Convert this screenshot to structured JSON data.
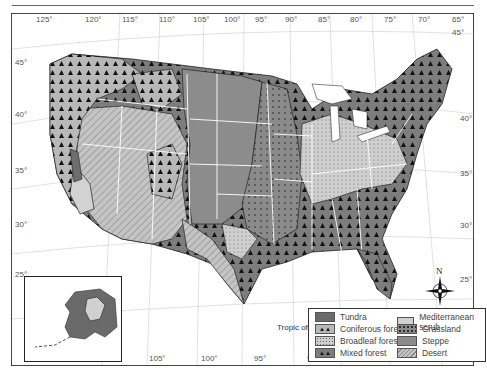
{
  "map": {
    "title": "Natural vegetation regions of the United States",
    "longitude_labels_top": [
      "125°",
      "120°",
      "115°",
      "110°",
      "105°",
      "100°",
      "95°",
      "90°",
      "85°",
      "80°",
      "75°",
      "70°",
      "65°"
    ],
    "longitude_labels_bottom": [
      "115°",
      "110°",
      "105°",
      "100°",
      "95°",
      "90°",
      "85°",
      "80°",
      "75°"
    ],
    "latitude_labels_left": [
      "45°",
      "40°",
      "35°",
      "30°",
      "25°"
    ],
    "latitude_labels_right": [
      "45°",
      "40°",
      "35°",
      "30°",
      "25°"
    ],
    "tropic_label": "Tropic of Cancer",
    "compass": {
      "north_label": "N"
    }
  },
  "legend": {
    "items": [
      {
        "label": "Tundra",
        "pattern": "solid-dark",
        "color": "#6a6a6a"
      },
      {
        "label": "Coniferous forest",
        "pattern": "triangles",
        "color": "#b8b8b8"
      },
      {
        "label": "Broadleaf forest",
        "pattern": "dots-light",
        "color": "#cfcfcf"
      },
      {
        "label": "Mixed forest",
        "pattern": "triangles-dark",
        "color": "#7d7d7d"
      },
      {
        "label": "Mediterranean scrub",
        "pattern": "solid-light",
        "color": "#d2d2d2"
      },
      {
        "label": "Grassland",
        "pattern": "dots-dark",
        "color": "#8a8a8a"
      },
      {
        "label": "Steppe",
        "pattern": "solid-mid",
        "color": "#8c8c8c"
      },
      {
        "label": "Desert",
        "pattern": "hatch",
        "color": "#bdbdbd"
      }
    ]
  }
}
